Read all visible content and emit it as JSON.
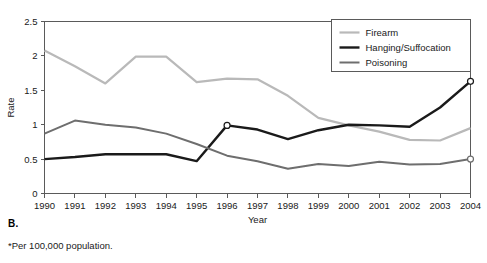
{
  "panel": {
    "label": "B.",
    "footnote": "*Per 100,000 population."
  },
  "chart_data": {
    "type": "line",
    "title": "",
    "xlabel": "Year",
    "ylabel": "Rate",
    "categories": [
      "1990",
      "1991",
      "1992",
      "1993",
      "1994",
      "1995",
      "1996",
      "1997",
      "1998",
      "1999",
      "2000",
      "2001",
      "2002",
      "2003",
      "2004"
    ],
    "x": [
      1990,
      1991,
      1992,
      1993,
      1994,
      1995,
      1996,
      1997,
      1998,
      1999,
      2000,
      2001,
      2002,
      2003,
      2004
    ],
    "xlim": [
      1990,
      2004
    ],
    "ylim": [
      0,
      2.5
    ],
    "yticks": [
      0,
      0.5,
      1,
      1.5,
      2,
      2.5
    ],
    "ytick_labels": [
      "0",
      "0.5",
      "1",
      "1.5",
      "2",
      "2.5"
    ],
    "grid": false,
    "legend_position": "top-right",
    "series": [
      {
        "name": "Firearm",
        "color": "#b9b9b9",
        "width": 2.2,
        "values": [
          2.08,
          1.85,
          1.6,
          1.99,
          1.99,
          1.62,
          1.67,
          1.66,
          1.42,
          1.1,
          0.99,
          0.9,
          0.78,
          0.77,
          0.95
        ],
        "markers": []
      },
      {
        "name": "Hanging/Suffocation",
        "color": "#1a1a1a",
        "width": 2.4,
        "values": [
          0.5,
          0.53,
          0.57,
          0.57,
          0.57,
          0.47,
          0.99,
          0.93,
          0.79,
          0.92,
          1.0,
          0.99,
          0.97,
          1.25,
          1.63
        ],
        "markers": [
          {
            "x": 1996,
            "y": 0.99
          },
          {
            "x": 2004,
            "y": 1.63
          }
        ]
      },
      {
        "name": "Poisoning",
        "color": "#6e6e6e",
        "width": 2.0,
        "values": [
          0.87,
          1.06,
          1.0,
          0.96,
          0.87,
          0.72,
          0.55,
          0.47,
          0.36,
          0.43,
          0.4,
          0.46,
          0.42,
          0.43,
          0.5
        ],
        "markers": [
          {
            "x": 2004,
            "y": 0.5
          }
        ]
      }
    ]
  }
}
